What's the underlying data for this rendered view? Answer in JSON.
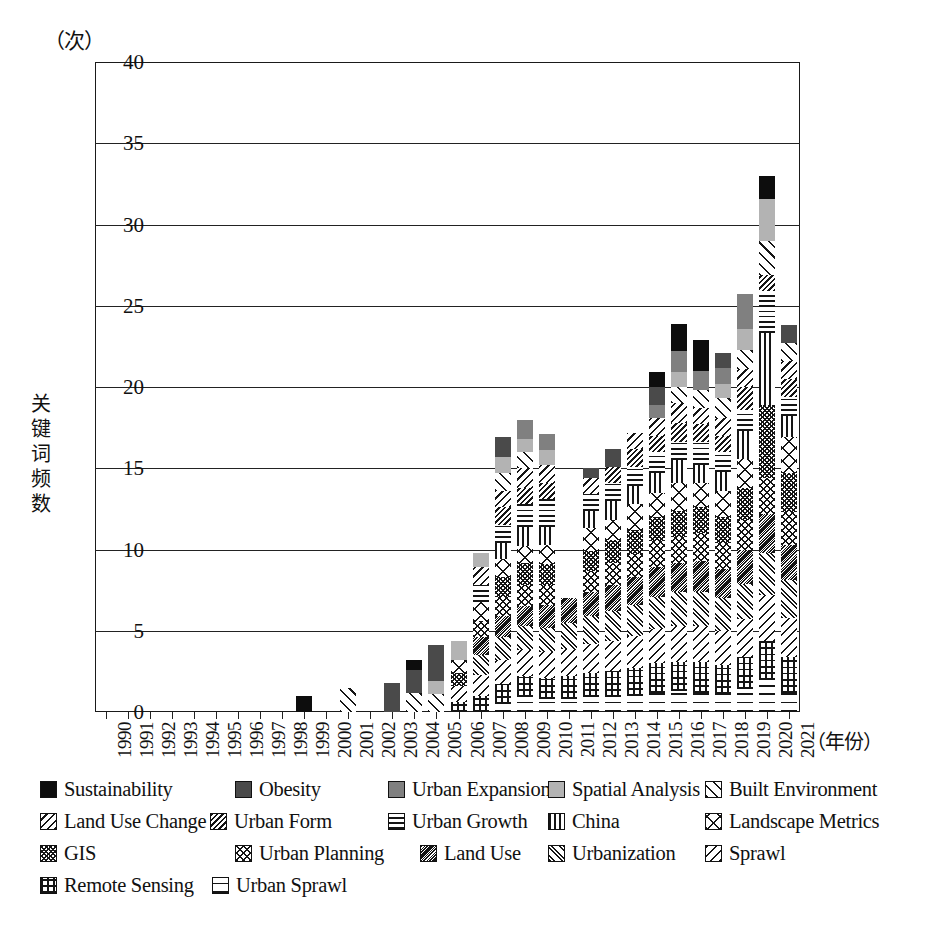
{
  "chart_data": {
    "type": "bar",
    "subtype": "stacked-bar",
    "title": "",
    "xlabel": "（年份）",
    "ylabel": "关键词频数",
    "y_unit_label": "（次）",
    "ylim": [
      0,
      40
    ],
    "ytick_values": [
      0,
      5,
      10,
      15,
      20,
      25,
      30,
      35,
      40
    ],
    "ytick_labels": [
      "0",
      "5",
      "10",
      "15",
      "20",
      "25",
      "30",
      "35",
      "40"
    ],
    "grid": true,
    "legend_position": "below-plot",
    "categories": [
      "1990",
      "1991",
      "1992",
      "1993",
      "1994",
      "1995",
      "1996",
      "1997",
      "1998",
      "1999",
      "2000",
      "2001",
      "2002",
      "2003",
      "2004",
      "2005",
      "2006",
      "2007",
      "2008",
      "2009",
      "2010",
      "2011",
      "2012",
      "2013",
      "2014",
      "2015",
      "2016",
      "2017",
      "2018",
      "2019",
      "2020",
      "2021"
    ],
    "series": [
      {
        "name": "Sustainability",
        "pattern": "solid-black",
        "values": [
          0,
          0,
          0,
          0,
          0,
          0,
          0,
          0,
          0,
          1,
          0,
          0,
          0,
          0,
          0.6,
          0,
          0,
          0,
          0,
          0,
          0,
          0,
          0,
          0,
          0,
          0.9,
          1.7,
          1.9,
          0,
          0,
          1.4,
          0
        ]
      },
      {
        "name": "Obesity",
        "pattern": "solid-dark",
        "values": [
          0,
          0,
          0,
          0,
          0,
          0,
          0,
          0,
          0,
          0,
          0,
          0,
          0,
          1.8,
          1.4,
          2.2,
          0,
          0,
          1.2,
          0,
          0,
          0,
          0.6,
          1.1,
          0,
          1.1,
          0,
          0,
          0.9,
          0,
          0,
          1.1
        ]
      },
      {
        "name": "Urban Expansion",
        "pattern": "solid-medium",
        "values": [
          0,
          0,
          0,
          0,
          0,
          0,
          0,
          0,
          0,
          0,
          0,
          0,
          0,
          0,
          0,
          0,
          0,
          0,
          0,
          1.2,
          1.0,
          0,
          0,
          0,
          0,
          0.8,
          1.3,
          1.2,
          1.0,
          2.1,
          0,
          0
        ]
      },
      {
        "name": "Spatial Analysis",
        "pattern": "solid-light",
        "values": [
          0,
          0,
          0,
          0,
          0,
          0,
          0,
          0,
          0,
          0,
          0,
          0,
          0,
          0,
          0,
          0.8,
          1.2,
          0.9,
          1.0,
          0.8,
          0.9,
          0,
          0,
          0,
          0,
          0,
          0.9,
          0,
          0.9,
          1.3,
          2.6,
          0
        ]
      },
      {
        "name": "Built Environment",
        "pattern": "diag-wide",
        "values": [
          0,
          0,
          0,
          0,
          0,
          0,
          0,
          0,
          0,
          0,
          0,
          1.5,
          0,
          0,
          1.2,
          1.1,
          0,
          0,
          1.1,
          1.0,
          0,
          0,
          0,
          0,
          0,
          0,
          1.0,
          1.1,
          1.2,
          1.2,
          2.1,
          1.1
        ]
      },
      {
        "name": "Land Use Change",
        "pattern": "diag-back",
        "values": [
          0,
          0,
          0,
          0,
          0,
          0,
          0,
          0,
          0,
          0,
          0,
          0,
          0,
          0,
          0,
          0,
          0,
          1.1,
          1.0,
          1.2,
          1.1,
          0,
          1.0,
          0,
          1.0,
          1.1,
          1.2,
          1.0,
          1.1,
          1.1,
          0,
          1.1
        ]
      },
      {
        "name": "Urban Form",
        "pattern": "diag-dense",
        "values": [
          0,
          0,
          0,
          0,
          0,
          0,
          0,
          0,
          0,
          0,
          0,
          0,
          0,
          0,
          0,
          0,
          0,
          0,
          1.1,
          1.0,
          1.0,
          0,
          0,
          1.0,
          1.1,
          1.0,
          1.2,
          1.1,
          1.0,
          1.4,
          1.0,
          1.1
        ]
      },
      {
        "name": "Urban Growth",
        "pattern": "horiz",
        "values": [
          0,
          0,
          0,
          0,
          0,
          0,
          0,
          0,
          0,
          0,
          0,
          0,
          0,
          0,
          0,
          0,
          0,
          1.0,
          1.1,
          1.4,
          1.7,
          0,
          1.0,
          1.1,
          1.2,
          1.3,
          1.1,
          1.4,
          1.2,
          1.3,
          2.6,
          1.2
        ]
      },
      {
        "name": "China",
        "pattern": "vert",
        "values": [
          0,
          0,
          0,
          0,
          0,
          0,
          0,
          0,
          0,
          0,
          0,
          0,
          0,
          0,
          0,
          0,
          0,
          0,
          1.0,
          1.2,
          1.1,
          0,
          1.1,
          1.2,
          1.1,
          1.2,
          1.4,
          1.1,
          1.2,
          1.7,
          4.4,
          1.3
        ]
      },
      {
        "name": "Landscape Metrics",
        "pattern": "xcross",
        "values": [
          0,
          0,
          0,
          0,
          0,
          0,
          0,
          0,
          0,
          0,
          0,
          0,
          0,
          0,
          0,
          0,
          0.8,
          1.2,
          1.1,
          1.0,
          1.2,
          0,
          1.4,
          1.2,
          1.6,
          1.5,
          1.7,
          1.5,
          1.6,
          1.8,
          0,
          2.2
        ]
      },
      {
        "name": "GIS",
        "pattern": "checker",
        "values": [
          0,
          0,
          0,
          0,
          0,
          0,
          0,
          0,
          0,
          0,
          0,
          0,
          0,
          0,
          0,
          0,
          0.8,
          0,
          1.2,
          1.4,
          1.3,
          0,
          1.2,
          1.4,
          1.5,
          1.5,
          1.6,
          1.6,
          1.6,
          2.0,
          4.5,
          2.4
        ]
      },
      {
        "name": "Urban Planning",
        "pattern": "xhatch",
        "values": [
          0,
          0,
          0,
          0,
          0,
          0,
          0,
          0,
          0,
          0,
          0,
          0,
          0,
          0,
          0,
          0,
          0,
          1.0,
          1.2,
          1.3,
          1.2,
          0,
          1.3,
          1.4,
          1.4,
          1.6,
          1.6,
          1.7,
          1.6,
          1.8,
          2.2,
          2.0
        ]
      },
      {
        "name": "Land Use",
        "pattern": "xhatch-dense",
        "values": [
          0,
          0,
          0,
          0,
          0,
          0,
          0,
          0,
          0,
          0,
          0,
          0,
          0,
          0,
          0,
          0,
          0,
          1.1,
          1.3,
          1.2,
          1.4,
          1.5,
          1.5,
          1.6,
          1.7,
          1.8,
          1.8,
          1.9,
          1.8,
          2.1,
          2.4,
          2.2
        ]
      },
      {
        "name": "Urbanization",
        "pattern": "diag-pair",
        "values": [
          0,
          0,
          0,
          0,
          0,
          0,
          0,
          0,
          0,
          0,
          0,
          0,
          0,
          0,
          0,
          0,
          0,
          1.2,
          1.4,
          1.5,
          1.5,
          1.6,
          1.7,
          1.8,
          1.9,
          2.0,
          2.1,
          2.1,
          2.0,
          2.2,
          2.6,
          2.3
        ]
      },
      {
        "name": "Sprawl",
        "pattern": "diag-med",
        "values": [
          0,
          0,
          0,
          0,
          0,
          0,
          0,
          0,
          0,
          0,
          0,
          0,
          0,
          0,
          0,
          0,
          1.0,
          1.3,
          1.5,
          1.6,
          1.6,
          1.7,
          1.8,
          1.9,
          2.0,
          2.1,
          2.2,
          2.2,
          2.1,
          2.3,
          2.8,
          2.4
        ]
      },
      {
        "name": "Remote Sensing",
        "pattern": "grid",
        "values": [
          0,
          0,
          0,
          0,
          0,
          0,
          0,
          0,
          0,
          0,
          0,
          0,
          0,
          0,
          0,
          0,
          0.6,
          1.0,
          1.2,
          1.3,
          1.3,
          1.4,
          1.5,
          1.6,
          1.7,
          1.8,
          1.8,
          1.9,
          1.8,
          2.0,
          2.4,
          2.2
        ]
      },
      {
        "name": "Urban Sprawl",
        "pattern": "horiz-sparse",
        "values": [
          0,
          0,
          0,
          0,
          0,
          0,
          0,
          0,
          0,
          0,
          0,
          0,
          0,
          0,
          0,
          0,
          0,
          0,
          0.5,
          0.9,
          0.8,
          0.8,
          0.9,
          0.9,
          1.0,
          1.2,
          1.3,
          1.2,
          1.1,
          1.4,
          2.0,
          1.2
        ]
      }
    ],
    "totals": [
      0,
      0,
      0,
      0,
      0,
      0,
      0,
      0,
      0,
      1,
      0,
      1.5,
      0,
      1.8,
      3.2,
      5.2,
      4.4,
      9.8,
      15.8,
      17.0,
      16.8,
      8.9,
      14.0,
      17.1,
      18.2,
      20.0,
      22.9,
      22.2,
      20.2,
      26.5,
      30.9,
      22.8
    ],
    "annotations": [
      "2020 bar extends above the 40 axis maximum, peaking near 42."
    ]
  },
  "legend": {
    "rows": [
      [
        {
          "label": "Sustainability",
          "pattern": "solid-black",
          "x": 0
        },
        {
          "label": "Obesity",
          "pattern": "solid-dark",
          "x": 195
        },
        {
          "label": "Urban Expansion",
          "pattern": "solid-medium",
          "x": 348
        },
        {
          "label": "Spatial Analysis",
          "pattern": "solid-light",
          "x": 508
        },
        {
          "label": "Built Environment",
          "pattern": "diag-wide",
          "x": 665
        }
      ],
      [
        {
          "label": "Land Use Change",
          "pattern": "diag-back",
          "x": 0
        },
        {
          "label": "Urban Form",
          "pattern": "diag-dense",
          "x": 170
        },
        {
          "label": "Urban Growth",
          "pattern": "horiz",
          "x": 348
        },
        {
          "label": "China",
          "pattern": "vert",
          "x": 508
        },
        {
          "label": "Landscape Metrics",
          "pattern": "xcross",
          "x": 665
        }
      ],
      [
        {
          "label": "GIS",
          "pattern": "checker",
          "x": 0
        },
        {
          "label": "Urban Planning",
          "pattern": "xhatch",
          "x": 195
        },
        {
          "label": "Land Use",
          "pattern": "xhatch-dense",
          "x": 380
        },
        {
          "label": "Urbanization",
          "pattern": "diag-pair",
          "x": 508
        },
        {
          "label": "Sprawl",
          "pattern": "diag-med",
          "x": 665
        }
      ],
      [
        {
          "label": "Remote Sensing",
          "pattern": "grid",
          "x": 0
        },
        {
          "label": "Urban Sprawl",
          "pattern": "horiz-sparse",
          "x": 172
        }
      ]
    ]
  }
}
